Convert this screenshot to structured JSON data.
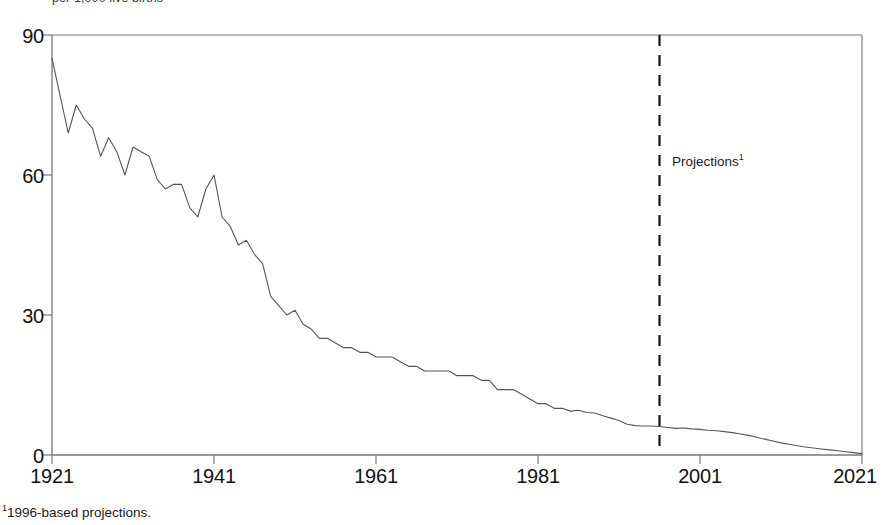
{
  "figure": {
    "clipped_header": "per 1,000 live births",
    "footnote_marker": "1",
    "footnote_text": "1996-based projections.",
    "projection_label": "Projections",
    "projection_label_marker": "1",
    "line_color": "#555555",
    "axis_color": "#777777",
    "divider_color": "#111111",
    "background": "#ffffff"
  },
  "chart_data": {
    "type": "line",
    "title": "",
    "subtitle": "",
    "xlabel": "",
    "ylabel": "per 1,000 live births",
    "xlim": [
      1921,
      2021
    ],
    "ylim": [
      0,
      90
    ],
    "xticks": [
      1921,
      1941,
      1961,
      1981,
      2001,
      2021
    ],
    "yticks": [
      0,
      30,
      60,
      90
    ],
    "grid": false,
    "legend": null,
    "annotations": [
      {
        "text": "Projections",
        "marker": "1",
        "x": 1996,
        "y": 62,
        "type": "vertical-divider-label"
      }
    ],
    "divider": {
      "x": 1996,
      "style": "dashed",
      "y_from": 0,
      "y_to": 90
    },
    "series": [
      {
        "name": "Infant mortality rate",
        "x": [
          1921,
          1922,
          1923,
          1924,
          1925,
          1926,
          1927,
          1928,
          1929,
          1930,
          1931,
          1932,
          1933,
          1934,
          1935,
          1936,
          1937,
          1938,
          1939,
          1940,
          1941,
          1942,
          1943,
          1944,
          1945,
          1946,
          1947,
          1948,
          1949,
          1950,
          1951,
          1952,
          1953,
          1954,
          1955,
          1956,
          1957,
          1958,
          1959,
          1960,
          1961,
          1962,
          1963,
          1964,
          1965,
          1966,
          1967,
          1968,
          1969,
          1970,
          1971,
          1972,
          1973,
          1974,
          1975,
          1976,
          1977,
          1978,
          1979,
          1980,
          1981,
          1982,
          1983,
          1984,
          1985,
          1986,
          1987,
          1988,
          1989,
          1990,
          1991,
          1992,
          1993,
          1994,
          1995,
          1996,
          1997,
          1998,
          1999,
          2000,
          2001,
          2002,
          2003,
          2004,
          2005,
          2006,
          2007,
          2008,
          2009,
          2010,
          2011,
          2012,
          2013,
          2014,
          2015,
          2016,
          2017,
          2018,
          2019,
          2020,
          2021
        ],
        "values": [
          85,
          77,
          69,
          75,
          72,
          70,
          64,
          68,
          65,
          60,
          66,
          65,
          64,
          59,
          57,
          58,
          58,
          53,
          51,
          57,
          60,
          51,
          49,
          45,
          46,
          43,
          41,
          34,
          32,
          30,
          31,
          28,
          27,
          25,
          25,
          24,
          23,
          23,
          22,
          22,
          21,
          21,
          21,
          20,
          19,
          19,
          18,
          18,
          18,
          18,
          17,
          17,
          17,
          16,
          16,
          14,
          14,
          14,
          13,
          12,
          11,
          11,
          10,
          10,
          9.4,
          9.6,
          9.1,
          9.0,
          8.4,
          7.9,
          7.4,
          6.6,
          6.3,
          6.2,
          6.2,
          6.1,
          5.9,
          5.7,
          5.8,
          5.6,
          5.5,
          5.3,
          5.2,
          5.0,
          4.8,
          4.5,
          4.2,
          3.8,
          3.4,
          3.0,
          2.6,
          2.3,
          2.0,
          1.7,
          1.5,
          1.3,
          1.1,
          0.9,
          0.7,
          0.5,
          0.3
        ]
      }
    ]
  }
}
